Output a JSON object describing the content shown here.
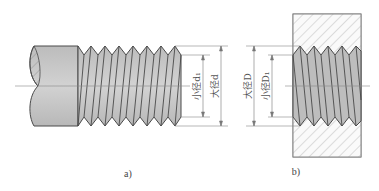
{
  "figure": {
    "panels": [
      {
        "id": "a",
        "caption": "a)",
        "subject": "external thread (bolt)"
      },
      {
        "id": "b",
        "caption": "b)",
        "subject": "internal thread (nut)"
      }
    ],
    "labels": {
      "minor_d1": "小径d₁",
      "major_d": "大径d",
      "major_D": "大径D",
      "minor_D1": "小径D₁"
    },
    "colors": {
      "body_fill": "#c8c8c8",
      "thread_fill": "#bdbdbd",
      "outline": "#4a4a4a",
      "hatch": "#8a8a8a",
      "dim_line": "#777777"
    }
  }
}
